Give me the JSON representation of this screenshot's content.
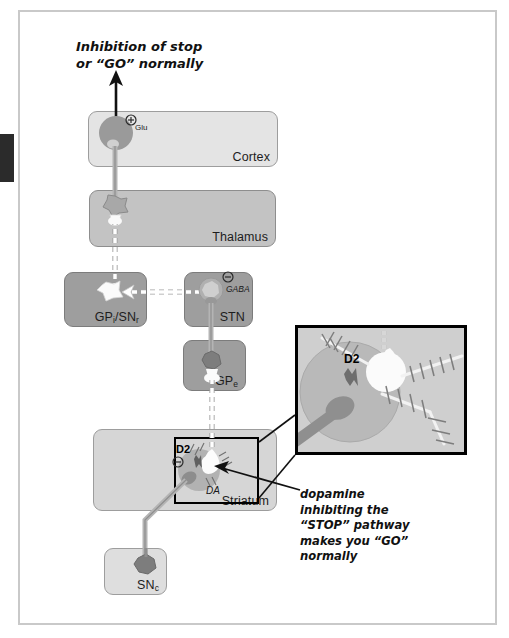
{
  "figure": {
    "type": "diagram",
    "title_line_1": "Inhibition of stop",
    "title_line_2": "or “GO” normally",
    "caption_line_1": "dopamine",
    "caption_line_2": "inhibiting the",
    "caption_line_3": "“STOP” pathway",
    "caption_line_4": "makes you “GO”",
    "caption_line_5": "normally"
  },
  "regions": {
    "cortex": {
      "label": "Cortex",
      "fill": "#e4e4e4"
    },
    "thalamus": {
      "label": "Thalamus",
      "fill": "#c3c3c3"
    },
    "gpi_snr": {
      "label": "GP",
      "label_sub_1": "i",
      "label_mid": "/SN",
      "label_sub_2": "r",
      "fill": "#9e9e9e"
    },
    "stn": {
      "label": "STN",
      "fill": "#9e9e9e"
    },
    "gpe": {
      "label": "GP",
      "label_sub": "e",
      "fill": "#9e9e9e"
    },
    "striatum": {
      "label": "Striatum",
      "fill": "#d6d6d6"
    },
    "snc": {
      "label": "SN",
      "label_sub": "c",
      "fill": "#dedede"
    }
  },
  "neurotransmitters": {
    "glu": {
      "sign": "⊕",
      "name": "Glu"
    },
    "gaba": {
      "sign": "⊖",
      "name": "GABA"
    },
    "da": {
      "name": "DA"
    },
    "d2_striatum": {
      "sign": "⊖",
      "name": "D2"
    },
    "d2_inset": {
      "name": "D2"
    }
  },
  "colors": {
    "frame_border": "#c9c9c9",
    "inset_border": "#000000",
    "neuron_body": "#9a9a9a",
    "axon_excitatory": "#9a9a9a",
    "axon_inhibitory_dashed": "#ffffff",
    "arrow_black": "#111111",
    "inset_background": "#cfcfcf",
    "inset_cell": "#b5b5b5"
  }
}
